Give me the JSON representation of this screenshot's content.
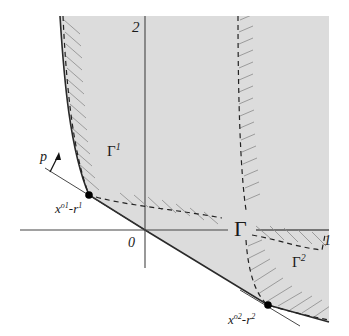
{
  "figure": {
    "colors": {
      "region_fill": "#dcdcdc",
      "line": "#2a2a2a",
      "axis": "#555555",
      "hatch": "#8a8a8a",
      "point": "#000000"
    },
    "labels": {
      "axis_2": "2",
      "axis_1": "1",
      "origin": "0",
      "gamma": "Γ",
      "gamma1_base": "Γ",
      "gamma1_sup": "1",
      "gamma2_base": "Γ",
      "gamma2_sup": "2",
      "p": "p",
      "point1_x": "x",
      "point1_x_sup": "o1",
      "point1_r": "-r",
      "point1_r_sup": "1",
      "point2_x": "x",
      "point2_x_sup": "o2",
      "point2_r": "-r",
      "point2_r_sup": "2"
    }
  }
}
